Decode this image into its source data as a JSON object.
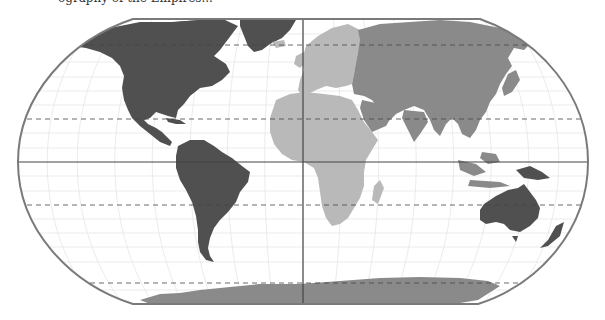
{
  "caption": "ography of the Empires...",
  "map": {
    "projection": "Robinson",
    "colors": {
      "dark": "#505050",
      "medium": "#8a8a8a",
      "light": "#b9b9b9",
      "frame": "#7a7a7a",
      "graticule": "#e4e4e4",
      "reference_lines": "#444444"
    },
    "regions": [
      {
        "name": "North America",
        "shade": "dark"
      },
      {
        "name": "Greenland",
        "shade": "dark"
      },
      {
        "name": "South America",
        "shade": "dark"
      },
      {
        "name": "Australia",
        "shade": "dark"
      },
      {
        "name": "New Guinea",
        "shade": "dark"
      },
      {
        "name": "Europe",
        "shade": "light"
      },
      {
        "name": "Africa",
        "shade": "light"
      },
      {
        "name": "Russia and Asia",
        "shade": "medium"
      },
      {
        "name": "Middle East",
        "shade": "medium"
      },
      {
        "name": "South Asia",
        "shade": "medium"
      },
      {
        "name": "Antarctica",
        "shade": "medium"
      }
    ],
    "lines": {
      "equator": "solid",
      "prime_meridian": "solid",
      "tropics": "dashed",
      "polar_circles": "dashed"
    }
  }
}
